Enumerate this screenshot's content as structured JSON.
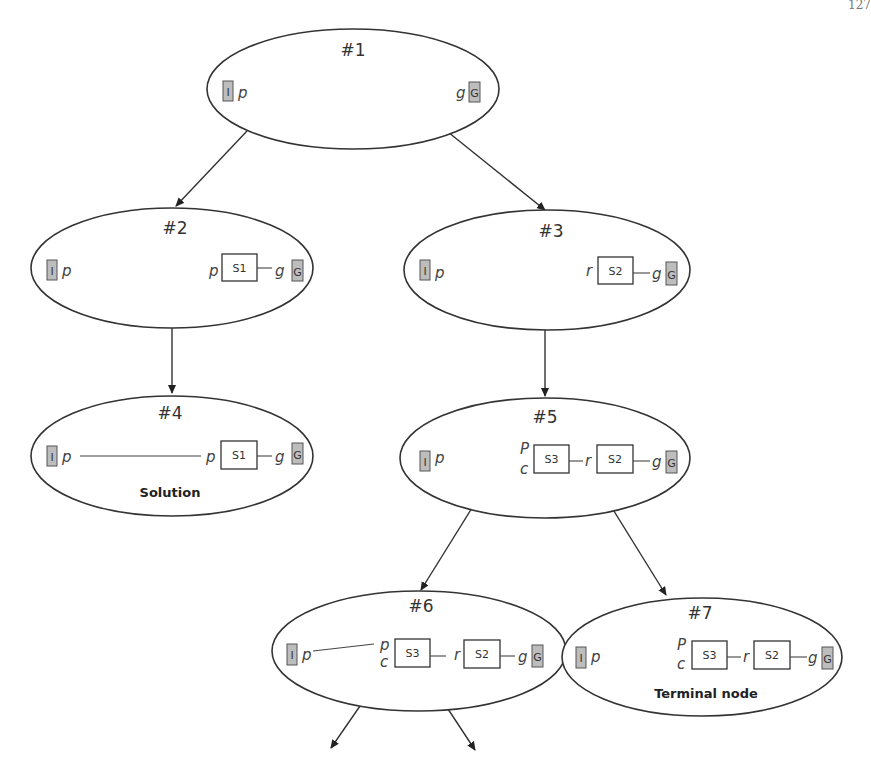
{
  "page": {
    "number": "127"
  },
  "colors": {
    "line": "#333333",
    "state_box_fill": "#bdbdbd",
    "background": "#ffffff"
  },
  "nodes": [
    {
      "id": "#1",
      "init": "I",
      "init_var": "p",
      "goal_var": "g",
      "goal": "G",
      "steps": []
    },
    {
      "id": "#2",
      "init": "I",
      "init_var": "p",
      "goal_var": "g",
      "goal": "G",
      "steps": [
        {
          "pre": "p",
          "name": "S1"
        }
      ]
    },
    {
      "id": "#3",
      "init": "I",
      "init_var": "p",
      "goal_var": "g",
      "goal": "G",
      "steps": [
        {
          "pre": "r",
          "name": "S2"
        }
      ]
    },
    {
      "id": "#4",
      "init": "I",
      "init_var": "p",
      "goal_var": "g",
      "goal": "G",
      "steps": [
        {
          "pre": "p",
          "name": "S1"
        }
      ],
      "caption": "Solution"
    },
    {
      "id": "#5",
      "init": "I",
      "init_var": "p",
      "goal_var": "g",
      "goal": "G",
      "steps": [
        {
          "pre_top": "P",
          "pre_bottom": "c",
          "name": "S3"
        },
        {
          "pre": "r",
          "name": "S2"
        }
      ]
    },
    {
      "id": "#6",
      "init": "I",
      "init_var": "p",
      "goal_var": "g",
      "goal": "G",
      "steps": [
        {
          "pre_top": "p",
          "pre_bottom": "c",
          "name": "S3"
        },
        {
          "pre": "r",
          "name": "S2"
        }
      ]
    },
    {
      "id": "#7",
      "init": "I",
      "init_var": "p",
      "goal_var": "g",
      "goal": "G",
      "steps": [
        {
          "pre_top": "P",
          "pre_bottom": "c",
          "name": "S3"
        },
        {
          "pre": "r",
          "name": "S2"
        }
      ],
      "caption": "Terminal node"
    }
  ],
  "edges": [
    {
      "from": "#1",
      "to": "#2"
    },
    {
      "from": "#1",
      "to": "#3"
    },
    {
      "from": "#2",
      "to": "#4"
    },
    {
      "from": "#3",
      "to": "#5"
    },
    {
      "from": "#5",
      "to": "#6"
    },
    {
      "from": "#5",
      "to": "#7"
    },
    {
      "from": "#6",
      "to": "(continues)"
    },
    {
      "from": "#6",
      "to": "(continues)"
    }
  ]
}
